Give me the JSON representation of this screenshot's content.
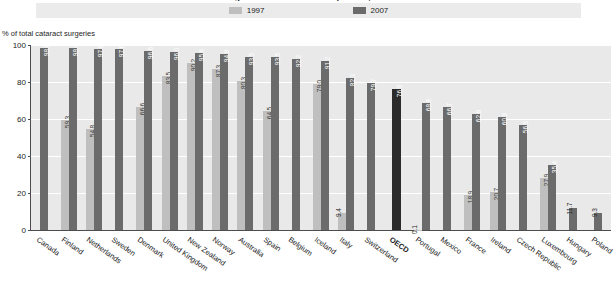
{
  "chart_title": "Cataract surgeries carried out as day cases, 1997 and 2007",
  "legend": {
    "items": [
      {
        "label": "1997",
        "color": "#bfbfbf"
      },
      {
        "label": "2007",
        "color": "#6b6b6b"
      }
    ]
  },
  "axis": {
    "y_caption": "% of total cataract surgeries",
    "ticks": [
      "0",
      "20",
      "40",
      "60",
      "80",
      "100"
    ]
  },
  "chart_data": {
    "type": "bar",
    "title": "Cataract surgeries carried out as day cases, 1997 and 2007",
    "xlabel": "",
    "ylabel": "% of total cataract surgeries",
    "ylim": [
      0,
      100
    ],
    "ytick_values": [
      0,
      20,
      40,
      60,
      80,
      100
    ],
    "grid": true,
    "legend_position": "top-center",
    "categories": [
      "Canada",
      "Finland",
      "Netherlands",
      "Sweden",
      "Denmark",
      "United Kingdom",
      "New Zealand",
      "Norway",
      "Australia",
      "Spain",
      "Belgium",
      "Iceland",
      "Italy",
      "Switzerland",
      "OECD",
      "Portugal",
      "Mexico",
      "France",
      "Ireland",
      "Czech Republic",
      "Luxembourg",
      "Hungary",
      "Poland"
    ],
    "series": [
      {
        "name": "1997",
        "color": "#bfbfbf",
        "values": [
          null,
          59.3,
          54.8,
          null,
          66.6,
          83.5,
          90.2,
          87.3,
          80.3,
          64.5,
          null,
          79.0,
          9.4,
          null,
          null,
          0.1,
          null,
          18.9,
          20.7,
          null,
          27.9,
          null,
          null
        ]
      },
      {
        "name": "2007",
        "color": "#6b6b6b",
        "values": [
          98.6,
          98.4,
          97.8,
          97.6,
          96.6,
          96.0,
          95.6,
          94.9,
          93.5,
          93.5,
          92.2,
          91.2,
          82.3,
          79.7,
          76.3,
          68.8,
          66.7,
          62.9,
          60.9,
          56.5,
          35.4,
          11.7,
          9.3
        ]
      }
    ],
    "highlight_category": "OECD",
    "highlight_color": "#2b2b2b"
  },
  "bars": [
    {
      "country": "Canada",
      "v97": null,
      "v07": 98.6,
      "lab97": "",
      "lab07": "98.6",
      "oecd": false
    },
    {
      "country": "Finland",
      "v97": 59.3,
      "v07": 98.4,
      "lab97": "59.3",
      "lab07": "98.4",
      "oecd": false
    },
    {
      "country": "Netherlands",
      "v97": 54.8,
      "v07": 97.8,
      "lab97": "54.8",
      "lab07": "97.8",
      "oecd": false
    },
    {
      "country": "Sweden",
      "v97": null,
      "v07": 97.6,
      "lab97": "",
      "lab07": "97.6",
      "oecd": false
    },
    {
      "country": "Denmark",
      "v97": 66.6,
      "v07": 96.6,
      "lab97": "66.6",
      "lab07": "96.6",
      "oecd": false
    },
    {
      "country": "United Kingdom",
      "v97": 83.5,
      "v07": 96.0,
      "lab97": "83.5",
      "lab07": "96.0",
      "oecd": false
    },
    {
      "country": "New Zealand",
      "v97": 90.2,
      "v07": 95.6,
      "lab97": "90.2",
      "lab07": "95.6",
      "oecd": false
    },
    {
      "country": "Norway",
      "v97": 87.3,
      "v07": 94.9,
      "lab97": "87.3",
      "lab07": "94.9",
      "oecd": false
    },
    {
      "country": "Australia",
      "v97": 80.3,
      "v07": 93.5,
      "lab97": "80.3",
      "lab07": "93.5",
      "oecd": false
    },
    {
      "country": "Spain",
      "v97": 64.5,
      "v07": 93.5,
      "lab97": "64.5",
      "lab07": "93.5",
      "oecd": false
    },
    {
      "country": "Belgium",
      "v97": null,
      "v07": 92.2,
      "lab97": "",
      "lab07": "92.2",
      "oecd": false
    },
    {
      "country": "Iceland",
      "v97": 79.0,
      "v07": 91.2,
      "lab97": "79.0",
      "lab07": "91.2",
      "oecd": false
    },
    {
      "country": "Italy",
      "v97": 9.4,
      "v07": 82.3,
      "lab97": "9.4",
      "lab07": "82.3",
      "oecd": false
    },
    {
      "country": "Switzerland",
      "v97": null,
      "v07": 79.7,
      "lab97": "",
      "lab07": "79.7",
      "oecd": false
    },
    {
      "country": "OECD",
      "v97": null,
      "v07": 76.3,
      "lab97": "",
      "lab07": "76.3",
      "oecd": true
    },
    {
      "country": "Portugal",
      "v97": 0.1,
      "v07": 68.8,
      "lab97": "0.1",
      "lab07": "68.8",
      "oecd": false
    },
    {
      "country": "Mexico",
      "v97": null,
      "v07": 66.7,
      "lab97": "",
      "lab07": "66.7",
      "oecd": false
    },
    {
      "country": "France",
      "v97": 18.9,
      "v07": 62.9,
      "lab97": "18.9",
      "lab07": "62.9",
      "oecd": false
    },
    {
      "country": "Ireland",
      "v97": 20.7,
      "v07": 60.9,
      "lab97": "20.7",
      "lab07": "60.9",
      "oecd": false
    },
    {
      "country": "Czech Republic",
      "v97": null,
      "v07": 56.5,
      "lab97": "",
      "lab07": "56.5",
      "oecd": false
    },
    {
      "country": "Luxembourg",
      "v97": 27.9,
      "v07": 35.4,
      "lab97": "27.9",
      "lab07": "35.4",
      "oecd": false
    },
    {
      "country": "Hungary",
      "v97": null,
      "v07": 11.7,
      "lab97": "",
      "lab07": "11.7",
      "oecd": false
    },
    {
      "country": "Poland",
      "v97": null,
      "v07": 9.3,
      "lab97": "",
      "lab07": "9.3",
      "oecd": false
    }
  ]
}
